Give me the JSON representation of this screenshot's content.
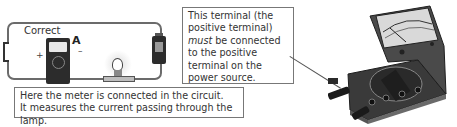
{
  "circuit": {
    "heading": "Correct",
    "ammeter_label": "A",
    "plus_sign": "+",
    "minus_sign": "–",
    "components": [
      "switch",
      "ammeter",
      "lamp",
      "battery"
    ]
  },
  "callouts": {
    "meter_in_circuit": {
      "line1": "Here the meter is connected in the circuit.",
      "line2": "It measures the current passing through the lamp."
    },
    "positive_terminal": {
      "line1": "This terminal (the",
      "line2": "positive terminal)",
      "line3_emph": "must",
      "line3_rest": " be connected",
      "line4": "to the positive",
      "line5": "terminal on the",
      "line6": "power source."
    }
  },
  "colors": {
    "wire": "#6b6b6b",
    "device_dark": "#2c2c2c",
    "box_border": "#777777",
    "text": "#333333"
  },
  "icons": [
    "switch-icon",
    "ammeter-icon",
    "lamp-icon",
    "battery-icon",
    "multimeter-icon"
  ]
}
